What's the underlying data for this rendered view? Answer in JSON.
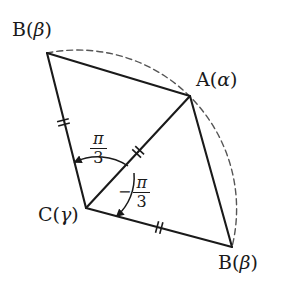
{
  "figure": {
    "background_color": "#ffffff",
    "stroke_color": "#1a1a1a",
    "dash_color": "#4a4a4a"
  },
  "vertices": [
    {
      "id": "b-top",
      "name": "B(β)",
      "letter": "B",
      "open_paren": "(",
      "greek": "β",
      "close_paren": ")",
      "x": 47,
      "y": 53,
      "label_x": 12,
      "label_y": 18
    },
    {
      "id": "a",
      "name": "A(α)",
      "letter": "A",
      "open_paren": "(",
      "greek": "α",
      "close_paren": ")",
      "x": 190,
      "y": 96,
      "label_x": 196,
      "label_y": 68
    },
    {
      "id": "c",
      "name": "C(γ)",
      "letter": "C",
      "open_paren": "(",
      "greek": "γ",
      "close_paren": ")",
      "x": 86,
      "y": 208,
      "label_x": 38,
      "label_y": 205
    },
    {
      "id": "b-bottom",
      "name": "B(β)",
      "letter": "B",
      "open_paren": "(",
      "greek": "β",
      "close_paren": ")",
      "x": 232,
      "y": 247,
      "label_x": 218,
      "label_y": 251
    }
  ],
  "segments": [
    {
      "id": "b-top-to-a",
      "from": "b-top",
      "to": "a",
      "ticks": 0
    },
    {
      "id": "b-top-to-c",
      "from": "b-top",
      "to": "c",
      "ticks": 2
    },
    {
      "id": "c-to-a",
      "from": "c",
      "to": "a",
      "ticks": 2
    },
    {
      "id": "c-to-b-bottom",
      "from": "c",
      "to": "b-bottom",
      "ticks": 2
    },
    {
      "id": "a-to-b-bottom",
      "from": "a",
      "to": "b-bottom",
      "ticks": 0
    }
  ],
  "arc": {
    "id": "rotation-arc",
    "style": "dashed",
    "center_id": "c",
    "from_id": "b-top",
    "to_id": "b-bottom",
    "through_id": "a"
  },
  "angles": [
    {
      "id": "angle-positive",
      "sign": "",
      "numerator": "π",
      "denominator": "3",
      "value_text": "π/3",
      "label_x": 88,
      "label_y": 132,
      "direction": "counterclockwise",
      "from_ray": "c-to-a",
      "to_ray": "c-to-b-top"
    },
    {
      "id": "angle-negative",
      "sign": "−",
      "numerator": "π",
      "denominator": "3",
      "value_text": "−π/3",
      "label_x": 120,
      "label_y": 176,
      "direction": "clockwise",
      "from_ray": "c-to-a",
      "to_ray": "c-to-b-bottom"
    }
  ]
}
